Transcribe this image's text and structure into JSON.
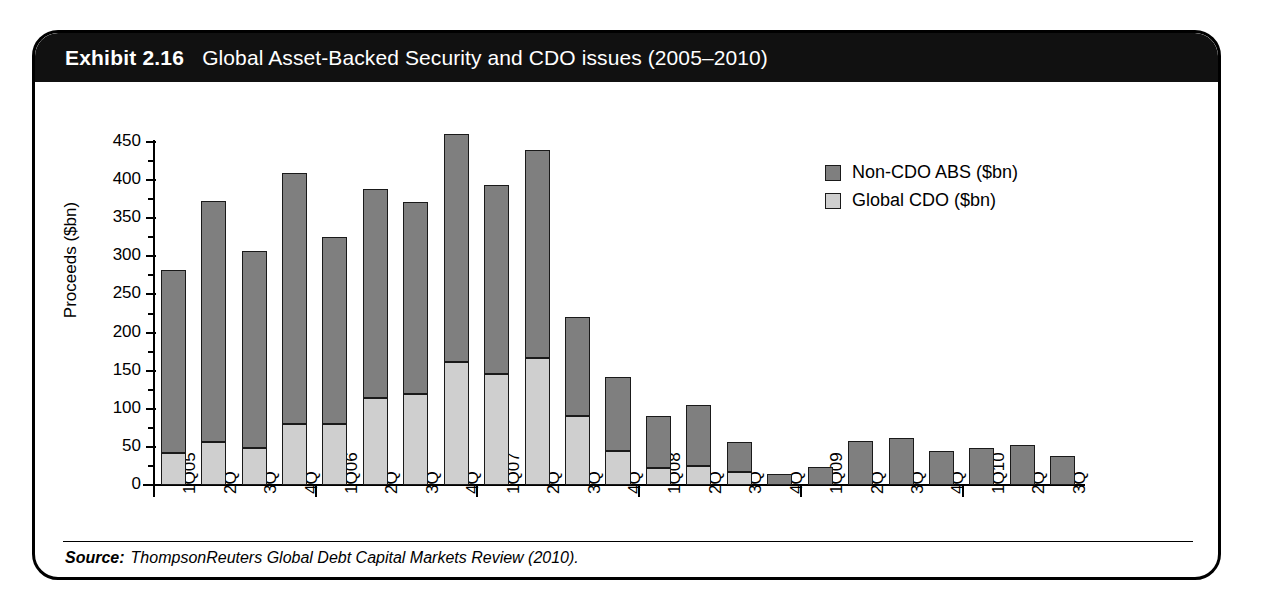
{
  "exhibit": {
    "number": "Exhibit 2.16",
    "title": "Global Asset-Backed Security and CDO issues (2005–2010)",
    "source_label": "Source:",
    "source_text": "ThompsonReuters Global Debt Capital Markets Review (2010)."
  },
  "colors": {
    "banner_bg": "#111111",
    "banner_text": "#ffffff",
    "non_cdo_abs": "#7f7f7f",
    "global_cdo": "#cfcfcf",
    "outline": "#1a1a1a",
    "card_border": "#000000"
  },
  "chart_data": {
    "type": "bar",
    "stacked": true,
    "title": "Global Asset-Backed Security and CDO issues (2005–2010)",
    "xlabel": "",
    "ylabel": "Proceeds ($bn)",
    "ylim": [
      0,
      450
    ],
    "ytick_step": 50,
    "ytick_labels": [
      "0",
      "50",
      "100",
      "150",
      "200",
      "250",
      "300",
      "350",
      "400",
      "450"
    ],
    "ytick_values": [
      0,
      50,
      100,
      150,
      200,
      250,
      300,
      350,
      400,
      450
    ],
    "grid": false,
    "legend_position": "upper right",
    "categories": [
      "1Q05",
      "2Q",
      "3Q",
      "4Q",
      "1Q06",
      "2Q",
      "3Q",
      "4Q",
      "1Q07",
      "2Q",
      "3Q",
      "4Q",
      "1Q08",
      "2Q",
      "3Q",
      "4Q",
      "1Q09",
      "2Q",
      "3Q",
      "4Q",
      "1Q10",
      "2Q",
      "3Q"
    ],
    "year_start_indices": [
      0,
      4,
      8,
      12,
      16,
      20
    ],
    "series": [
      {
        "name": "Global CDO ($bn)",
        "color": "#cfcfcf",
        "values": [
          42,
          56,
          48,
          80,
          80,
          114,
          120,
          162,
          145,
          166,
          90,
          45,
          22,
          25,
          17,
          0,
          0,
          0,
          0,
          0,
          0,
          0,
          0
        ]
      },
      {
        "name": "Non-CDO ABS ($bn)",
        "color": "#7f7f7f",
        "values": [
          240,
          316,
          259,
          330,
          246,
          274,
          251,
          299,
          249,
          273,
          130,
          97,
          68,
          80,
          40,
          15,
          23,
          58,
          62,
          44,
          48,
          53,
          38
        ]
      }
    ],
    "totals": [
      282,
      372,
      307,
      410,
      326,
      388,
      371,
      461,
      394,
      439,
      220,
      142,
      90,
      105,
      57,
      15,
      23,
      58,
      62,
      44,
      48,
      53,
      38
    ]
  },
  "legend": {
    "entries": [
      {
        "label": "Non-CDO ABS ($bn)",
        "swatch": "#7f7f7f"
      },
      {
        "label": "Global CDO ($bn)",
        "swatch": "#cfcfcf"
      }
    ]
  }
}
